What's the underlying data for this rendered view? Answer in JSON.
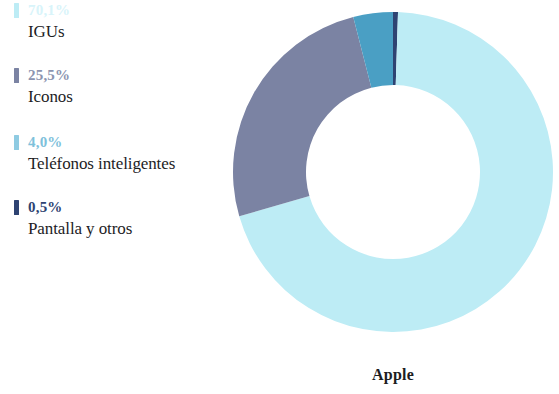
{
  "chart_data": {
    "type": "pie",
    "variant": "donut",
    "title": "Apple",
    "xlabel": "",
    "ylabel": "",
    "legend_position": "left",
    "grid": false,
    "start_angle_deg": 0,
    "direction": "clockwise",
    "categories": [
      "IGUs",
      "Iconos",
      "Teléfonos inteligentes",
      "Pantalla y otros"
    ],
    "values": [
      70.1,
      25.5,
      4.0,
      0.5
    ],
    "value_labels": [
      "70,1%",
      "25,5%",
      "4,0%",
      "0,5%"
    ],
    "colors": [
      "#bdecf5",
      "#7b83a3",
      "#4a9fc4",
      "#2e4372"
    ],
    "slices": [
      {
        "label": "IGUs",
        "value": 70.1,
        "value_label": "70,1%",
        "color": "#bdecf5"
      },
      {
        "label": "Iconos",
        "value": 25.5,
        "value_label": "25,5%",
        "color": "#7b83a3"
      },
      {
        "label": "Teléfonos inteligentes",
        "value": 4.0,
        "value_label": "4,0%",
        "color": "#4a9fc4"
      },
      {
        "label": "Pantalla y otros",
        "value": 0.5,
        "value_label": "0,5%",
        "color": "#2e4372"
      }
    ]
  },
  "legend": {
    "items": [
      {
        "percent": "70,1%",
        "label": "IGUs",
        "color": "#bdecf5"
      },
      {
        "percent": "25,5%",
        "label": "Iconos",
        "color": "#7b83a3"
      },
      {
        "percent": "4,0%",
        "label": "Teléfonos inteligentes",
        "color": "#4a9fc4"
      },
      {
        "percent": "0,5%",
        "label": "Pantalla y otros",
        "color": "#2e4372"
      }
    ]
  },
  "caption": {
    "text": "Apple"
  }
}
